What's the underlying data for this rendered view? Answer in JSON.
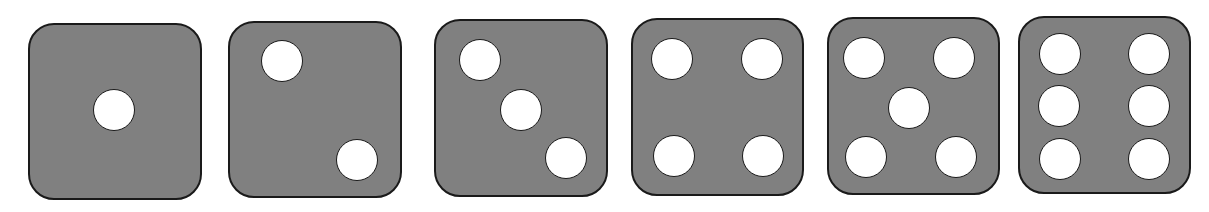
{
  "dice": [
    {
      "value": 1,
      "x": 28,
      "y": 23,
      "w": 174,
      "h": 177,
      "pips": [
        [
          114,
          110
        ]
      ]
    },
    {
      "value": 2,
      "x": 228,
      "y": 21,
      "w": 174,
      "h": 177,
      "pips": [
        [
          282,
          61
        ],
        [
          357,
          160
        ]
      ]
    },
    {
      "value": 3,
      "x": 434,
      "y": 19,
      "w": 174,
      "h": 178,
      "pips": [
        [
          480,
          60
        ],
        [
          521,
          110
        ],
        [
          566,
          158
        ]
      ]
    },
    {
      "value": 4,
      "x": 631,
      "y": 18,
      "w": 173,
      "h": 178,
      "pips": [
        [
          672,
          59
        ],
        [
          762,
          59
        ],
        [
          674,
          156
        ],
        [
          763,
          156
        ]
      ]
    },
    {
      "value": 5,
      "x": 827,
      "y": 17,
      "w": 173,
      "h": 178,
      "pips": [
        [
          864,
          58
        ],
        [
          954,
          58
        ],
        [
          909,
          108
        ],
        [
          866,
          157
        ],
        [
          956,
          157
        ]
      ]
    },
    {
      "value": 6,
      "x": 1018,
      "y": 16,
      "w": 173,
      "h": 178,
      "pips": [
        [
          1060,
          54
        ],
        [
          1149,
          54
        ],
        [
          1059,
          106
        ],
        [
          1149,
          106
        ],
        [
          1060,
          159
        ],
        [
          1149,
          159
        ]
      ]
    }
  ],
  "colors": {
    "face": "#808080",
    "pip": "#ffffff",
    "outline": "#1a1a1a"
  }
}
